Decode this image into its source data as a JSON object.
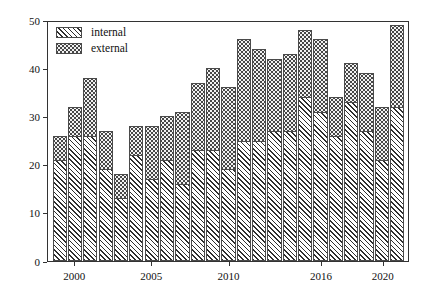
{
  "chart_data": {
    "type": "bar",
    "stacked": true,
    "title": "",
    "xlabel": "",
    "ylabel": "",
    "ylim": [
      0,
      50
    ],
    "yticks": [
      0,
      10,
      20,
      30,
      40,
      50
    ],
    "grid": false,
    "legend_position": "top-left",
    "categories": [
      1999,
      2000,
      2001,
      2002,
      2003,
      2004,
      2005,
      2006,
      2007,
      2008,
      2009,
      2010,
      2011,
      2012,
      2013,
      2014,
      2015,
      2016,
      2017,
      2018,
      2019,
      2020,
      2021
    ],
    "xtick_labels": [
      "2000",
      "2005",
      "2010",
      "2016",
      "2020"
    ],
    "xtick_categories": [
      2000,
      2005,
      2010,
      2016,
      2020
    ],
    "series": [
      {
        "name": "internal",
        "pattern": "diagonal-hatch",
        "values": [
          21,
          26,
          26,
          19,
          13,
          22,
          17,
          21,
          16,
          23,
          23,
          19,
          25,
          25,
          27,
          27,
          34,
          31,
          26,
          33,
          27,
          21,
          32
        ]
      },
      {
        "name": "external",
        "pattern": "dotted",
        "values": [
          5,
          6,
          12,
          8,
          5,
          6,
          11,
          9,
          15,
          14,
          17,
          17,
          21,
          19,
          15,
          16,
          14,
          15,
          8,
          8,
          12,
          11,
          17
        ]
      }
    ],
    "totals": [
      26,
      32,
      38,
      27,
      18,
      28,
      28,
      30,
      31,
      37,
      40,
      36,
      46,
      44,
      42,
      43,
      48,
      46,
      34,
      41,
      39,
      32,
      49
    ]
  },
  "legend": {
    "items": [
      {
        "label": "internal",
        "swatch": "diagonal-hatch-swatch"
      },
      {
        "label": "external",
        "swatch": "dotted-swatch"
      }
    ]
  },
  "colors": {
    "axis": "#333333",
    "hatch": "#2e2e2e",
    "dot": "#3a3a3a",
    "external_fill": "#f2f2f2",
    "background": "#ffffff"
  }
}
